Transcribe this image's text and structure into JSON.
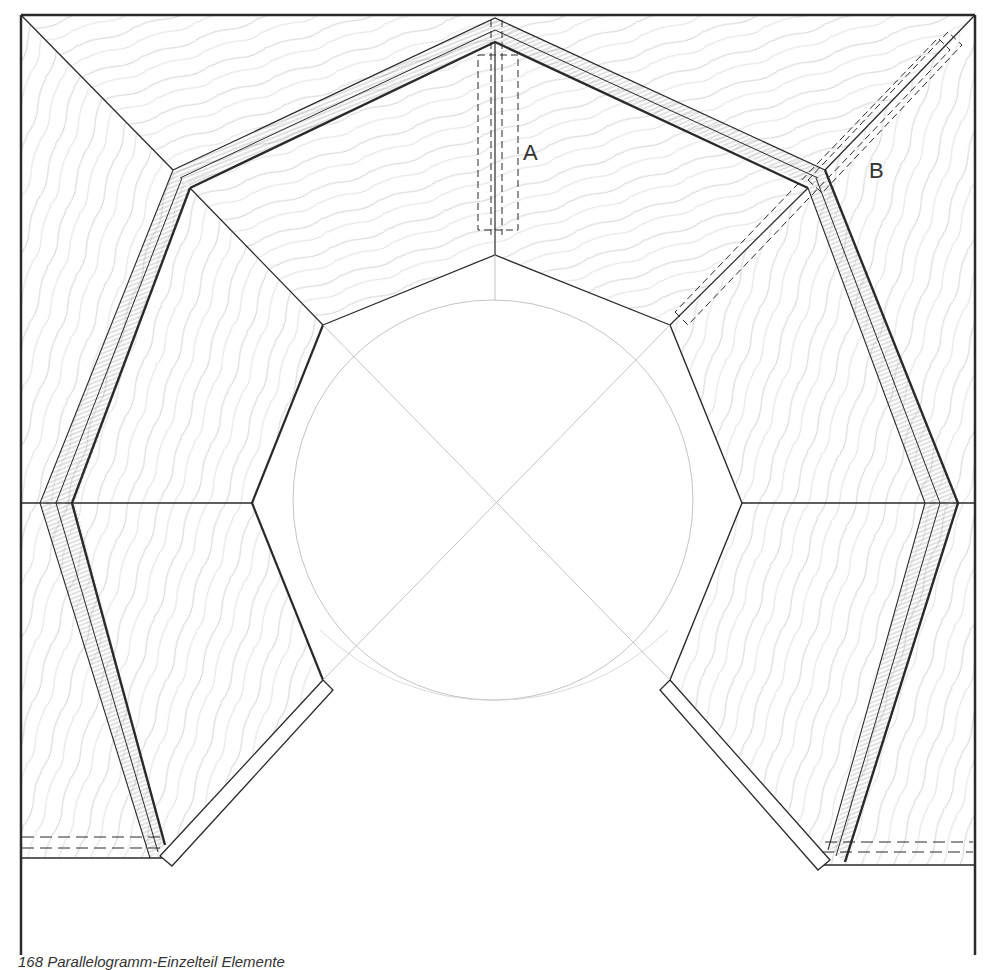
{
  "figure": {
    "caption": "168 Parallelogramm-Einzelteil Elemente",
    "labels": {
      "a": "A",
      "b": "B"
    }
  },
  "colors": {
    "line": "#2a2a2a",
    "grain": "#bdbdbd",
    "construction": "#b0b0b0",
    "background": "#ffffff"
  }
}
